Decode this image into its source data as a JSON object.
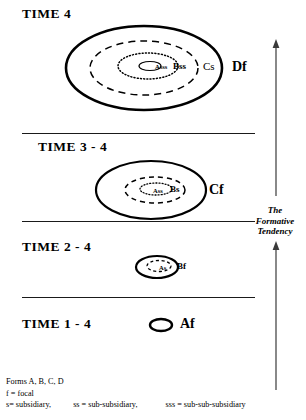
{
  "figure": {
    "title_rows": [
      {
        "id": "time4",
        "label": "TIME  4"
      },
      {
        "id": "time3_4",
        "label": "TIME  3 - 4"
      },
      {
        "id": "time2_4",
        "label": "TIME  2 - 4"
      },
      {
        "id": "time1_4",
        "label": "TIME  1 - 4"
      }
    ],
    "labels": {
      "time4": {
        "outer": "Df",
        "second": "Cs",
        "third": "Bss",
        "inner": "Asss"
      },
      "time3_4": {
        "outer": "Cf",
        "second": "Bs",
        "inner": "Ass"
      },
      "time2_4": {
        "outer": "Bf",
        "inner": "As"
      },
      "time1_4": {
        "outer": "Af"
      }
    },
    "tendency": {
      "line1": "The",
      "line2": "Formative",
      "line3": "Tendency"
    },
    "legend": {
      "line1": "Forms A, B, C, D",
      "line2": "f = focal",
      "line3_a": "s= subsidiary,",
      "line3_b": "ss = sub-subsidiary,",
      "line3_c": "sss = sub-sub-subsidiary"
    },
    "colors": {
      "ink": "#000000",
      "rule": "#1a1a1a",
      "background": "#ffffff"
    }
  }
}
